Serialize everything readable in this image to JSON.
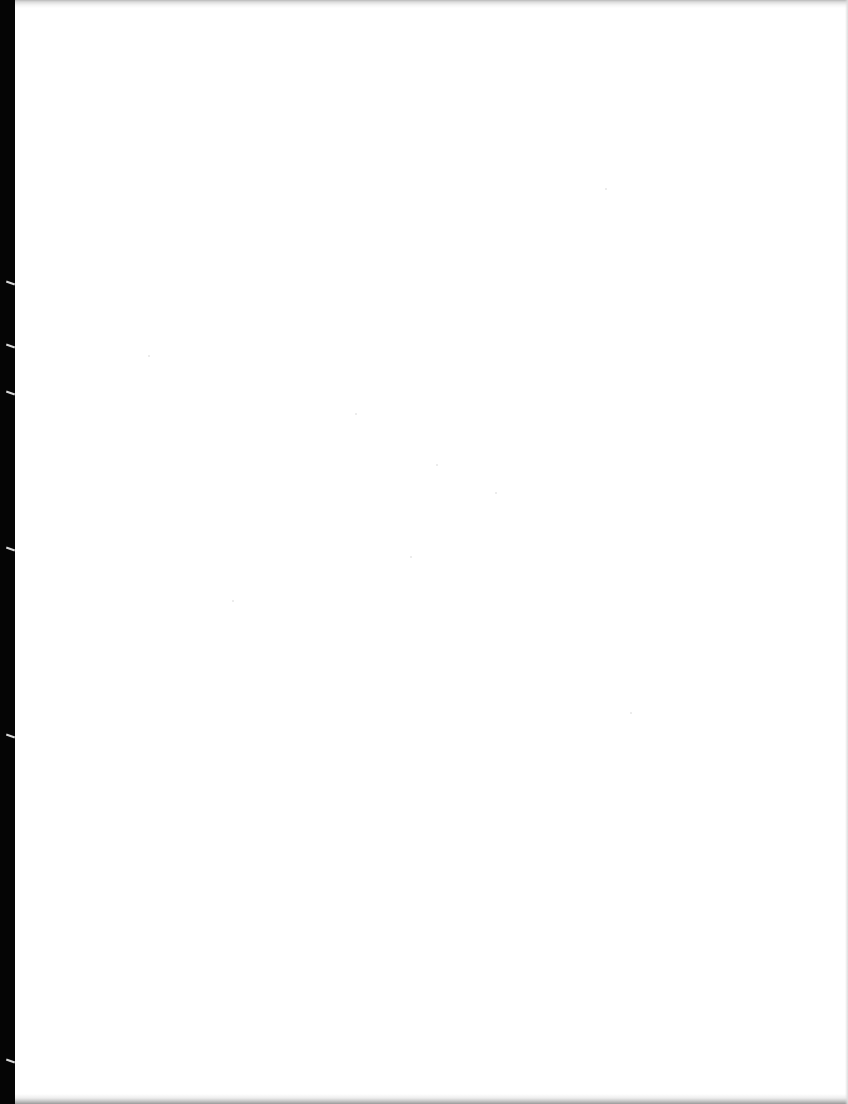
{
  "document": {
    "type": "blank-scanned-page",
    "text": "",
    "colors": {
      "page": "#ffffff",
      "binding_edge": "#050505",
      "border_shadow": "#b8b8b8"
    }
  }
}
